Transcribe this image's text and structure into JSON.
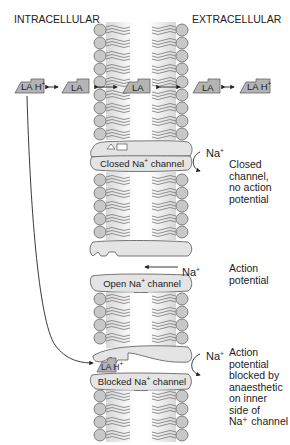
{
  "headers": {
    "intracellular": "INTRACELLULAR",
    "extracellular": "EXTRACELLULAR"
  },
  "molecules": [
    {
      "label": "LA H",
      "charge": "+",
      "side": "intracellular-protonated"
    },
    {
      "label": "LA",
      "charge": "",
      "side": "intracellular-base"
    },
    {
      "label": "LA",
      "charge": "",
      "side": "membrane"
    },
    {
      "label": "LA",
      "charge": "",
      "side": "extracellular-base"
    },
    {
      "label": "LA H",
      "charge": "+",
      "side": "extracellular-protonated"
    }
  ],
  "channels": {
    "closed": {
      "label": "Closed Na",
      "charge": "+",
      "suffix": " channel"
    },
    "open": {
      "label": "Open Na",
      "charge": "+",
      "suffix": " channel"
    },
    "blocked": {
      "label": "Blocked Na",
      "charge": "+",
      "suffix": " channel",
      "bound_drug": "LA H",
      "bound_charge": "+"
    }
  },
  "ions": {
    "closed": {
      "label": "Na",
      "charge": "+"
    },
    "open": {
      "label": "Na",
      "charge": "+"
    },
    "blocked": {
      "label": "Na",
      "charge": "+"
    }
  },
  "notes": {
    "closed": [
      "Closed",
      "channel,",
      "no action",
      "potential"
    ],
    "open": [
      "Action",
      "potential"
    ],
    "blocked": [
      "Action",
      "potential",
      "blocked by",
      "anaesthetic",
      "on inner",
      "side of",
      "Na⁺ channel"
    ]
  },
  "colors": {
    "lipid_head": "#c8c8c8",
    "lipid_outline": "#666666",
    "channel_fill": "#e4e4e4",
    "molecule_fill": "#b4b4b4",
    "stroke": "#333333",
    "text": "#222222"
  }
}
